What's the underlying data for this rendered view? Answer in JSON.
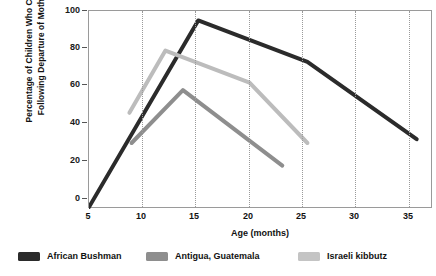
{
  "chart_data": {
    "type": "line",
    "title": "",
    "xlabel": "Age (months)",
    "ylabel": "Percentage of Children Who Cried Following Departure of Mother",
    "ylabel_lines": [
      "Percentage of Children Who Cried",
      "Following Departure of Mother"
    ],
    "xlim": [
      5,
      36.5
    ],
    "ylim": [
      0,
      105
    ],
    "xticks": [
      5,
      10,
      15,
      20,
      25,
      30,
      35
    ],
    "yticks": [
      0,
      20,
      40,
      60,
      80,
      100
    ],
    "grid": "vertical-dotted",
    "legend_position": "below",
    "series": [
      {
        "name": "African Bushman",
        "color": "#2b2b2b",
        "x": [
          5,
          15,
          25,
          35
        ],
        "y": [
          1,
          100,
          78,
          37
        ]
      },
      {
        "name": "Antigua, Guatemala",
        "color": "#8e8e8e",
        "x": [
          8.9,
          13.6,
          22.7
        ],
        "y": [
          35,
          63,
          23
        ]
      },
      {
        "name": "Israeli kibbutz",
        "color": "#bcbcbc",
        "x": [
          8.7,
          12,
          19.7,
          25
        ],
        "y": [
          51,
          84,
          67,
          35
        ]
      }
    ]
  },
  "axes": {
    "y_title_line1": "Percentage of Children Who Cried",
    "y_title_line2": "Following Departure of Mother",
    "x_title": "Age (months)",
    "y_tick_labels": [
      "100",
      "80",
      "60",
      "40",
      "20",
      "0"
    ],
    "x_tick_labels": [
      "5",
      "10",
      "15",
      "20",
      "25",
      "30",
      "35"
    ]
  },
  "legend": {
    "items": [
      {
        "label": "African Bushman",
        "color": "#2b2b2b"
      },
      {
        "label": "Antigua, Guatemala",
        "color": "#8e8e8e"
      },
      {
        "label": "Israeli kibbutz",
        "color": "#c4c4c4"
      }
    ]
  }
}
